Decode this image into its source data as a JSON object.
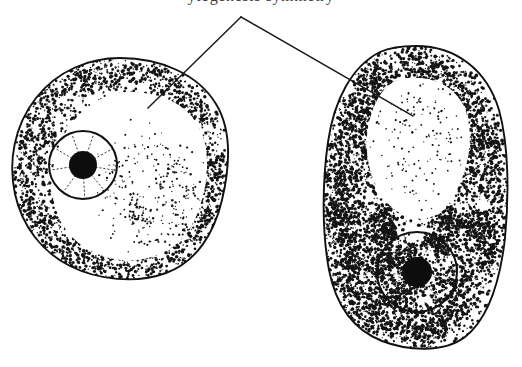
{
  "figure": {
    "title_partial": "ytogenesis symmetry",
    "background_color": "#ffffff",
    "ink_color": "#111111",
    "width": 522,
    "height": 367
  },
  "caption": {
    "text": "ytogenesis symmetry",
    "note": "top caption line is cropped; only letter descenders visible"
  },
  "leader": {
    "apex_label": "leader-apex",
    "left_target": "left-cell-cytoplasm",
    "right_target": "right-cell-cytoplasm"
  },
  "cells": [
    {
      "id": "left-cell",
      "name": "left-cell",
      "shape": "round",
      "outline_color": "#111111",
      "bounds": {
        "x": 12,
        "y": 56,
        "w": 216,
        "h": 224
      },
      "nucleus": {
        "name": "left-cell-nucleus",
        "center_x": 83,
        "center_y": 165,
        "radius": 35,
        "nucleolus_radius": 14,
        "spokes": 9
      },
      "stipple_density": "medium",
      "vacuole": "clear central region"
    },
    {
      "id": "right-cell",
      "name": "right-cell",
      "shape": "oval",
      "outline_color": "#111111",
      "bounds": {
        "x": 322,
        "y": 46,
        "w": 186,
        "h": 302
      },
      "nucleus": {
        "name": "right-cell-nucleus",
        "center_x": 417,
        "center_y": 272,
        "radius": 41,
        "nucleolus_radius": 15,
        "spokes": 9
      },
      "stipple_density": "heavy",
      "vacuole": "clear upper lobed region"
    }
  ]
}
